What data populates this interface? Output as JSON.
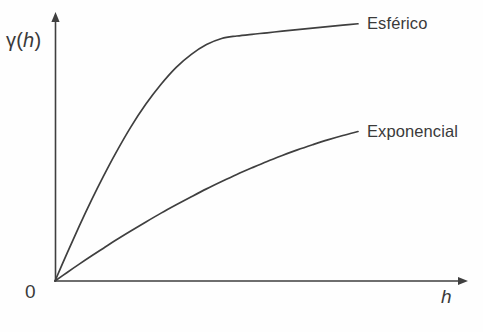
{
  "figure": {
    "background_color": "#fefefe",
    "line_color": "#3f3f3f",
    "text_color": "#3a3a3a"
  },
  "axes": {
    "y_label_prefix": "γ(",
    "y_label_var": "h",
    "y_label_suffix": ")",
    "y_label_full": "γ(h)",
    "x_label": "h",
    "origin_label": "0"
  },
  "labels": {
    "spherical": "Esférico",
    "exponential": "Exponencial"
  },
  "chart_data": {
    "type": "line",
    "title": "",
    "subtitle": "",
    "xlabel": "h",
    "ylabel": "γ(h)",
    "xlim": [
      0,
      1
    ],
    "ylim": [
      0,
      1
    ],
    "grid": false,
    "legend_position": "right-of-curve-ends",
    "annotations": [
      "0"
    ],
    "axis_arrows": [
      "x-positive",
      "y-positive"
    ],
    "series": [
      {
        "name": "Esférico",
        "model": "spherical",
        "sill": 1.0,
        "range": 0.78,
        "nugget": 0.0,
        "x": [
          0.0,
          0.04,
          0.08,
          0.12,
          0.16,
          0.2,
          0.25,
          0.3,
          0.35,
          0.4,
          0.45,
          0.5,
          0.55,
          0.6,
          0.65,
          0.7,
          0.75,
          0.8,
          0.85,
          0.9,
          0.95,
          1.0
        ],
        "y": [
          0.0,
          0.114,
          0.224,
          0.329,
          0.428,
          0.521,
          0.628,
          0.722,
          0.803,
          0.872,
          0.925,
          0.965,
          0.99,
          1.0,
          1.007,
          1.013,
          1.02,
          1.026,
          1.032,
          1.038,
          1.044,
          1.05
        ]
      },
      {
        "name": "Exponencial",
        "model": "exponential",
        "sill": 0.62,
        "range": 0.92,
        "nugget": 0.0,
        "x": [
          0.0,
          0.04,
          0.08,
          0.12,
          0.16,
          0.2,
          0.25,
          0.3,
          0.35,
          0.4,
          0.45,
          0.5,
          0.55,
          0.6,
          0.65,
          0.7,
          0.75,
          0.8,
          0.85,
          0.9,
          0.95,
          1.0
        ],
        "y": [
          0.0,
          0.035,
          0.069,
          0.102,
          0.134,
          0.166,
          0.204,
          0.241,
          0.277,
          0.311,
          0.344,
          0.376,
          0.406,
          0.435,
          0.462,
          0.488,
          0.512,
          0.535,
          0.556,
          0.576,
          0.594,
          0.61
        ]
      }
    ]
  }
}
